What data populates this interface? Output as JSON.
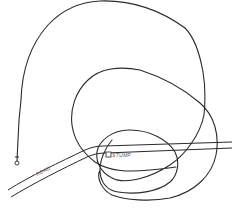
{
  "diagram": {
    "type": "track-path-illustration",
    "labels": {
      "road": "ROAD",
      "stump": "STUMP"
    },
    "colors": {
      "ink": "#2a2a2a",
      "label": "#555555",
      "background": "#ffffff"
    },
    "elements": [
      {
        "name": "start-marker",
        "shape": "small circle",
        "position": [
          17,
          164
        ]
      },
      {
        "name": "path",
        "description": "single continuous looping line starting at marker, making large loop then nested loops around the stump"
      },
      {
        "name": "road",
        "description": "double line road running from lower-left to right"
      },
      {
        "name": "stump",
        "shape": "small square",
        "position": [
          107,
          156
        ]
      }
    ]
  }
}
